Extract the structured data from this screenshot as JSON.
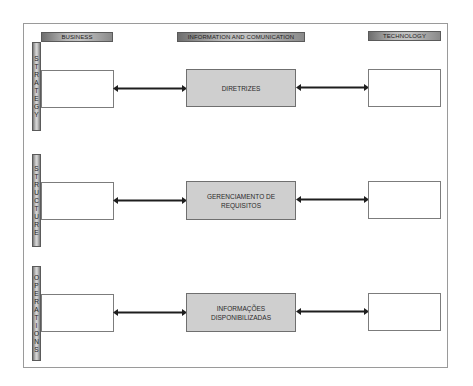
{
  "diagram": {
    "columns": {
      "business": "BUSINESS",
      "info": "INFORMATION AND COMUNICATION",
      "technology": "TECHNOLOGY"
    },
    "rows": [
      {
        "label": "STRATEGY",
        "letters": [
          "S",
          "T",
          "R",
          "A",
          "T",
          "E",
          "G",
          "Y"
        ],
        "center": [
          "DIRETRIZES"
        ]
      },
      {
        "label": "STRUCTURE",
        "letters": [
          "S",
          "T",
          "R",
          "U",
          "C",
          "T",
          "U",
          "R",
          "E"
        ],
        "center": [
          "GERENCIAMENTO DE",
          "REQUISITOS"
        ]
      },
      {
        "label": "OPERATIONS",
        "letters": [
          "O",
          "P",
          "E",
          "R",
          "A",
          "T",
          "I",
          "O",
          "N",
          "S"
        ],
        "center": [
          "INFORMAÇÕES",
          "DISPONIBILIZADAS"
        ]
      }
    ],
    "colors": {
      "center_fill": "#cfcfcf",
      "border": "#7c7c7c",
      "arrow": "#1e1e1e"
    }
  }
}
